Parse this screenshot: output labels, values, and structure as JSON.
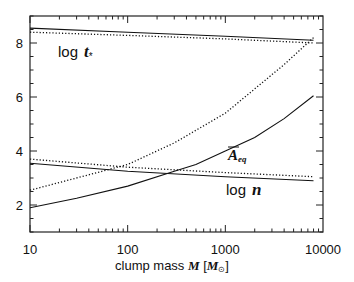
{
  "chart_data": {
    "type": "line",
    "title": "",
    "xlabel": "clump mass M [M☉]",
    "ylabel": "",
    "xscale": "log",
    "xlim": [
      10,
      10000
    ],
    "ylim": [
      1,
      9
    ],
    "x_ticks": [
      10,
      100,
      1000,
      10000
    ],
    "x_tick_labels": [
      "10",
      "100",
      "1000",
      "10000"
    ],
    "y_ticks": [
      2,
      4,
      6,
      8
    ],
    "y_tick_labels": [
      "2",
      "4",
      "6",
      "8"
    ],
    "grid": false,
    "legend": null,
    "annotations": [
      {
        "text": "log t*",
        "x": 15,
        "y": 7.8
      },
      {
        "text": "Ā_eq",
        "x": 1000,
        "y": 4.4
      },
      {
        "text": "log n",
        "x": 1200,
        "y": 2.75
      }
    ],
    "series": [
      {
        "name": "log t* (solid)",
        "style": "solid",
        "x": [
          10,
          100,
          1000,
          8000
        ],
        "y": [
          8.55,
          8.4,
          8.25,
          8.1
        ]
      },
      {
        "name": "log t* (dotted)",
        "style": "dotted",
        "x": [
          10,
          100,
          1000,
          8000
        ],
        "y": [
          8.4,
          8.28,
          8.15,
          8.0
        ]
      },
      {
        "name": "A_eq (dotted)",
        "style": "dotted",
        "x": [
          10,
          30,
          100,
          300,
          1000,
          2000,
          4000,
          8000
        ],
        "y": [
          2.55,
          3.0,
          3.5,
          4.3,
          5.4,
          6.3,
          7.2,
          8.2
        ]
      },
      {
        "name": "A_eq (solid)",
        "style": "solid",
        "x": [
          10,
          30,
          100,
          300,
          500,
          1000,
          2000,
          4000,
          8000
        ],
        "y": [
          1.9,
          2.25,
          2.7,
          3.25,
          3.5,
          4.0,
          4.5,
          5.2,
          6.05
        ]
      },
      {
        "name": "log n (solid)",
        "style": "solid",
        "x": [
          10,
          100,
          1000,
          8000
        ],
        "y": [
          3.55,
          3.25,
          3.05,
          2.9
        ]
      },
      {
        "name": "log n (dotted)",
        "style": "dotted",
        "x": [
          10,
          100,
          1000,
          8000
        ],
        "y": [
          3.7,
          3.4,
          3.2,
          3.05
        ]
      }
    ]
  },
  "labels": {
    "x_axis_prefix": "clump mass ",
    "x_axis_var": "M",
    "x_axis_unit_open": "[",
    "x_axis_unit": "M",
    "x_axis_unit_sub": "⊙",
    "x_axis_unit_close": "]",
    "anno_t_log": "log",
    "anno_t_var": "t",
    "anno_t_sub": "*",
    "anno_a_var": "A",
    "anno_a_sub": "eq",
    "anno_n_log": "log",
    "anno_n_var": "n"
  }
}
